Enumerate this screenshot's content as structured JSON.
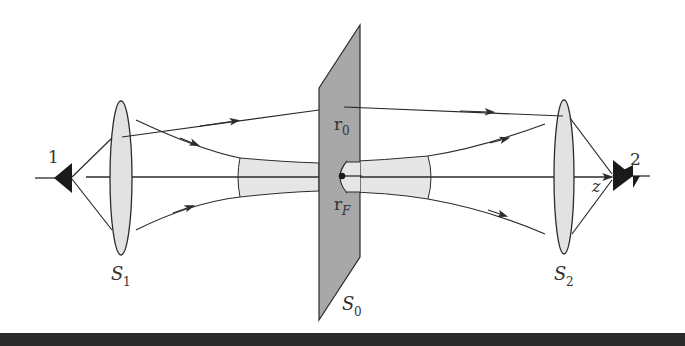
{
  "diagram": {
    "colors": {
      "line": "#2b2b2b",
      "lens_fill": "#e2e2e2",
      "plane_fill": "#a8a8a8",
      "beam_fill": "#e6e6e6",
      "detector": "#1a1a1a",
      "bottom_bar": "#2a2a2a"
    },
    "labels": {
      "detector_1": "1",
      "detector_2": "2",
      "lens_1": "S",
      "lens_1_sub": "1",
      "lens_2": "S",
      "lens_2_sub": "2",
      "plane": "S",
      "plane_sub": "0",
      "point_r0": "r",
      "point_r0_sub": "0",
      "point_rF": "r",
      "point_rF_sub": "F",
      "axis": "z"
    },
    "elements": [
      {
        "id": "detector-1",
        "type": "source/detector",
        "label": "1"
      },
      {
        "id": "lens-s1",
        "type": "lens",
        "label": "S1"
      },
      {
        "id": "plane-s0",
        "type": "plane",
        "label": "S0"
      },
      {
        "id": "lens-s2",
        "type": "lens",
        "label": "S2"
      },
      {
        "id": "detector-2",
        "type": "source/detector",
        "label": "2"
      },
      {
        "id": "optical-axis",
        "type": "axis",
        "label": "z"
      }
    ]
  }
}
